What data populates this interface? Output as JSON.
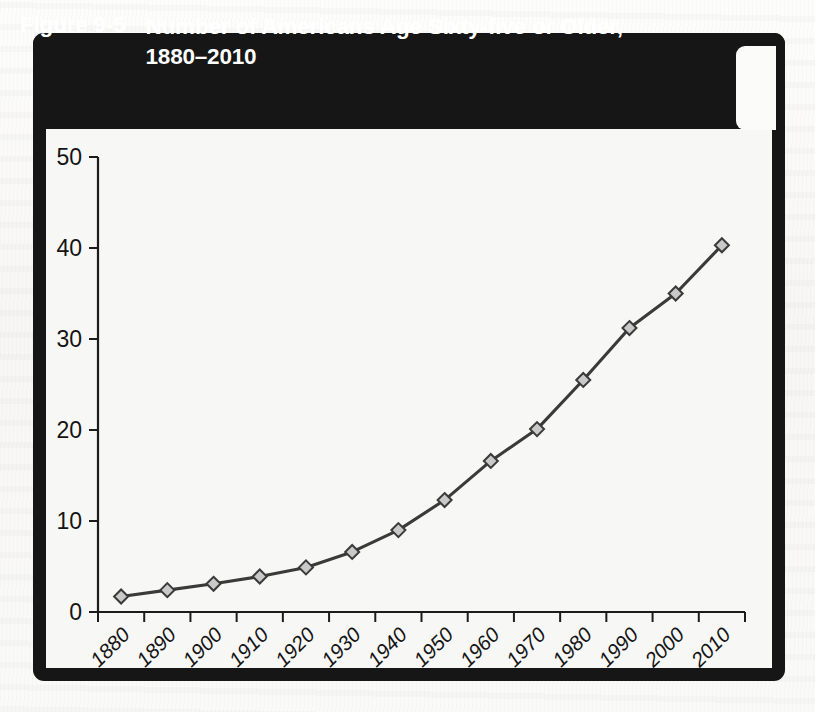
{
  "figure": {
    "number": "Figure 9-5",
    "title": "Number of Americans Age Sixty-five or Older, 1880–2010",
    "title_line1": "Number of Americans Age Sixty-five or Older,",
    "title_line2": "1880–2010",
    "header_background": "#161616",
    "header_text_color": "#ffffff",
    "page_background": "#fbfbfa",
    "plot_background": "#f7f7f5"
  },
  "chart_data": {
    "type": "line",
    "title": "Number of Americans Age Sixty-five or Older, 1880–2010",
    "subtitle": "",
    "xlabel": "",
    "ylabel": "",
    "categories": [
      "1880",
      "1890",
      "1900",
      "1910",
      "1920",
      "1930",
      "1940",
      "1950",
      "1960",
      "1970",
      "1980",
      "1990",
      "2000",
      "2010"
    ],
    "x": [
      1880,
      1890,
      1900,
      1910,
      1920,
      1930,
      1940,
      1950,
      1960,
      1970,
      1980,
      1990,
      2000,
      2010
    ],
    "values": [
      1.7,
      2.4,
      3.1,
      3.9,
      4.9,
      6.6,
      9.0,
      12.3,
      16.6,
      20.1,
      25.5,
      31.2,
      35.0,
      40.3
    ],
    "series": [
      {
        "name": "Americans age 65 or older (millions)",
        "values": [
          1.7,
          2.4,
          3.1,
          3.9,
          4.9,
          6.6,
          9.0,
          12.3,
          16.6,
          20.1,
          25.5,
          31.2,
          35.0,
          40.3
        ]
      }
    ],
    "ylim": [
      0,
      50
    ],
    "yticks": [
      0,
      10,
      20,
      30,
      40,
      50
    ],
    "ytick_labels": [
      "0",
      "10",
      "20",
      "30",
      "40",
      "50"
    ],
    "xtick_labels": [
      "1880",
      "1890",
      "1900",
      "1910",
      "1920",
      "1930",
      "1940",
      "1950",
      "1960",
      "1970",
      "1980",
      "1990",
      "2000",
      "2010"
    ],
    "grid": false,
    "legend": false,
    "legend_position": "none",
    "marker": "diamond",
    "marker_fill": "#c9c9c9",
    "marker_stroke": "#3a3a3a",
    "line_color": "#3a3a3a",
    "axis_color": "#1c1c1c",
    "xtick_label_rotation": -45
  }
}
